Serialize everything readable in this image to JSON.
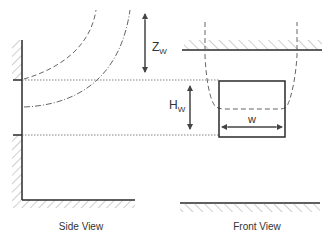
{
  "side_view": {
    "caption": "Side View",
    "dimension_z": {
      "main": "Z",
      "sub": "W"
    },
    "dimension_h": {
      "main": "H",
      "sub": "W"
    }
  },
  "front_view": {
    "caption": "Front View",
    "dimension_w": "w"
  },
  "colors": {
    "line": "#2a2a2a",
    "hatch": "#777777",
    "dashed": "#555555",
    "dotted": "#666666",
    "arrow": "#444444"
  }
}
